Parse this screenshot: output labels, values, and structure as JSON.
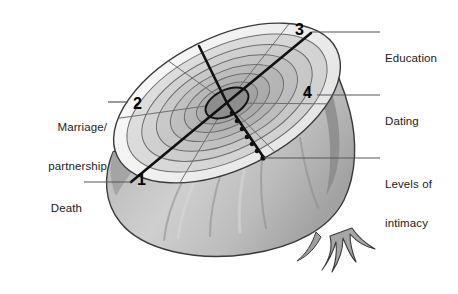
{
  "figure": {
    "type": "labelled-diagram",
    "background": "#ffffff",
    "palette": {
      "outline": "#2b2b2b",
      "rim_light": "#f2f2f2",
      "disc_light": "#d9d9d9",
      "disc_mid": "#c2c2c2",
      "disc_dark": "#ababab",
      "core": "#8f8f8f",
      "bulb_light": "#c9c9c9",
      "bulb_shadow": "#9a9a9a",
      "leader_line": "#5a5a6a",
      "text": "#1b1b1b"
    }
  },
  "numbers": [
    {
      "id": "1",
      "label": "1",
      "x": 137,
      "y": 172,
      "meaning": "Death"
    },
    {
      "id": "2",
      "label": "2",
      "x": 133,
      "y": 96,
      "meaning": "Marriage/partnership"
    },
    {
      "id": "3",
      "label": "3",
      "x": 295,
      "y": 22,
      "meaning": "Education"
    },
    {
      "id": "4",
      "label": "4",
      "x": 303,
      "y": 85,
      "meaning": "Dating"
    }
  ],
  "callouts": [
    {
      "id": "marriage",
      "name": "marriage-partnership",
      "lines": [
        "Marriage/",
        "partnership"
      ],
      "side": "left",
      "text_x": 27,
      "text_y": 95,
      "leader": {
        "x1": 108,
        "y1": 102,
        "x2": 128,
        "y2": 102
      }
    },
    {
      "id": "death",
      "name": "death",
      "lines": [
        "Death"
      ],
      "side": "left",
      "text_x": 42,
      "text_y": 176,
      "leader": {
        "x1": 84,
        "y1": 182,
        "x2": 131,
        "y2": 182
      }
    },
    {
      "id": "education",
      "name": "education",
      "lines": [
        "Education"
      ],
      "side": "right",
      "text_x": 385,
      "text_y": 26,
      "leader": {
        "x1": 312,
        "y1": 32,
        "x2": 380,
        "y2": 32
      }
    },
    {
      "id": "dating",
      "name": "dating",
      "lines": [
        "Dating"
      ],
      "side": "right",
      "text_x": 385,
      "text_y": 89,
      "leader": {
        "x1": 317,
        "y1": 95,
        "x2": 380,
        "y2": 95
      }
    },
    {
      "id": "levels",
      "name": "levels-of-intimacy",
      "lines": [
        "Levels of",
        "intimacy"
      ],
      "side": "right",
      "text_x": 385,
      "text_y": 152,
      "leader": {
        "x1": 264,
        "y1": 158,
        "x2": 380,
        "y2": 158
      }
    }
  ],
  "structure": {
    "rings_count": 7,
    "spokes_count": 6,
    "intimacy_dots": 7,
    "core_label": "centre",
    "axis_main": "1-to-3 diagonal",
    "axis_cross": "2-to-4 diagonal"
  }
}
